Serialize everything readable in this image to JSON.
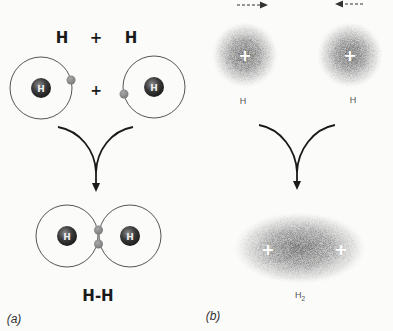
{
  "panel_a": {
    "label": "(a)",
    "equation": {
      "left": "H",
      "plus": "+",
      "right": "H"
    },
    "atoms_plus": "+",
    "nucleus_label": "H",
    "product_label": "H-H"
  },
  "panel_b": {
    "label": "(b)",
    "atom_left_label": "H",
    "atom_right_label": "H",
    "nucleus_symbol": "+",
    "product_label": "H",
    "product_subscript": "2"
  },
  "colors": {
    "background": "#fbfbfa",
    "orbit": "#555555",
    "nucleus": "#3a3a3a",
    "electron": "#8c8c8c",
    "cloud": "#9a9a9a",
    "arrow": "#1a1a1a"
  }
}
